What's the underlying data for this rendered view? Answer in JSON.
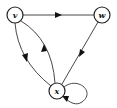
{
  "diagram": {
    "type": "directed-graph",
    "nodes": [
      {
        "id": "v",
        "label": "v"
      },
      {
        "id": "w",
        "label": "w"
      },
      {
        "id": "x",
        "label": "x"
      }
    ],
    "edges": [
      {
        "from": "v",
        "to": "w"
      },
      {
        "from": "w",
        "to": "x"
      },
      {
        "from": "v",
        "to": "x"
      },
      {
        "from": "x",
        "to": "v"
      },
      {
        "from": "x",
        "to": "x"
      }
    ],
    "colors": {
      "stroke": "#222222",
      "background": "#ffffff"
    }
  }
}
